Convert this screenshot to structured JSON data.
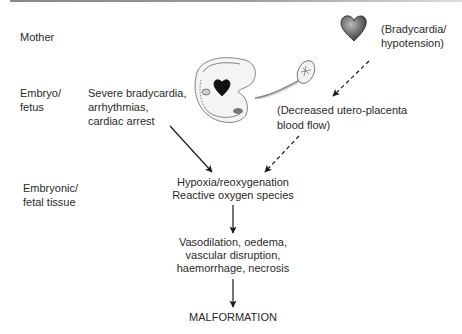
{
  "row_labels": {
    "mother": "Mother",
    "embryo_fetus_1": "Embryo/",
    "embryo_fetus_2": "fetus",
    "tissue_1": "Embryonic/",
    "tissue_2": "fetal tissue"
  },
  "embryo_effects": {
    "line1": "Severe bradycardia,",
    "line2": "arrhythmias,",
    "line3": "cardiac arrest"
  },
  "mother_effects": {
    "line1": "(Bradycardia/",
    "line2": "hypotension)"
  },
  "placenta_effect": {
    "line1": "(Decreased utero-placenta",
    "line2": "blood flow)"
  },
  "step1": {
    "line1": "Hypoxia/reoxygenation",
    "line2": "Reactive oxygen species"
  },
  "step2": {
    "line1": "Vasodilation, oedema,",
    "line2": "vascular disruption,",
    "line3": "haemorrhage, necrosis"
  },
  "outcome": "MALFORMATION",
  "icons": [
    "heart-icon",
    "embryo-illustration"
  ]
}
